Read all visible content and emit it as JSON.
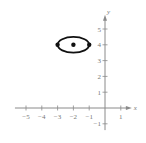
{
  "chart_data": {
    "type": "scatter",
    "title": "",
    "xlabel": "x",
    "ylabel": "y",
    "xlim": [
      -5.7,
      1.7
    ],
    "ylim": [
      -1.4,
      5.9
    ],
    "x_ticks": [
      -5,
      -4,
      -3,
      -2,
      -1,
      1
    ],
    "x_tick_labels": [
      "−5",
      "−4",
      "−3",
      "−2",
      "−1",
      "1"
    ],
    "y_ticks": [
      -1,
      1,
      2,
      3,
      4,
      5
    ],
    "y_tick_labels": [
      "−1",
      "1",
      "2",
      "3",
      "4",
      "5"
    ],
    "grid": false,
    "legend": "none",
    "curves": [
      {
        "name": "ellipse",
        "kind": "ellipse",
        "center": [
          -2,
          4
        ],
        "rx": 1,
        "ry": 0.5
      }
    ],
    "points": [
      {
        "name": "center",
        "x": -2,
        "y": 4
      },
      {
        "name": "vertex-left",
        "x": -3,
        "y": 4
      },
      {
        "name": "vertex-right",
        "x": -1,
        "y": 4
      }
    ],
    "colors": {
      "axis": "#8a8a8a",
      "curve": "#111111",
      "label": "#777777"
    }
  }
}
